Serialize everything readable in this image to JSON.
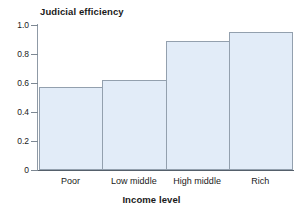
{
  "chart_data": {
    "type": "bar",
    "title": "",
    "categories": [
      "Poor",
      "Low middle",
      "High middle",
      "Rich"
    ],
    "values": [
      0.57,
      0.62,
      0.89,
      0.95
    ],
    "series": [
      {
        "name": "Judicial efficiency",
        "values": [
          0.57,
          0.62,
          0.89,
          0.95
        ]
      }
    ],
    "xlabel": "Income level",
    "ylabel": "Judicial efficiency",
    "ylim": [
      0,
      1.0
    ],
    "yticks": [
      0,
      0.2,
      0.4,
      0.6,
      0.8,
      1.0
    ],
    "ytick_labels": [
      "0",
      "0.2",
      "0.4",
      "0.6",
      "0.8",
      "1.0"
    ],
    "grid": false,
    "legend": false,
    "legend_position": "none",
    "bar_fill_color": "#e2ecf8",
    "bar_border_color": "#93a0ae",
    "axis_color": "#55606b",
    "background_color": "#ffffff"
  },
  "axes": {
    "y_title": "Judicial efficiency",
    "x_title": "Income level"
  }
}
